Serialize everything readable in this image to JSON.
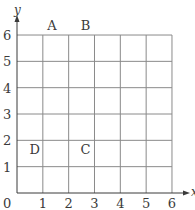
{
  "diagram": {
    "type": "coordinate-grid",
    "axes": {
      "x_label": "x",
      "y_label": "y",
      "origin_label": "0",
      "x_ticks": [
        "1",
        "2",
        "3",
        "4",
        "5",
        "6"
      ],
      "y_ticks": [
        "1",
        "2",
        "3",
        "4",
        "5",
        "6"
      ],
      "x_range": [
        0,
        6
      ],
      "y_range": [
        0,
        6
      ]
    },
    "points": [
      {
        "label": "A",
        "x": 1,
        "y": 6
      },
      {
        "label": "B",
        "x": 3,
        "y": 6
      },
      {
        "label": "C",
        "x": 3,
        "y": 2
      },
      {
        "label": "D",
        "x": 1,
        "y": 2
      }
    ],
    "colors": {
      "grid": "#8a8a8a",
      "axis": "#3a3a3a",
      "text": "#3a3a3a",
      "background": "#ffffff"
    }
  }
}
